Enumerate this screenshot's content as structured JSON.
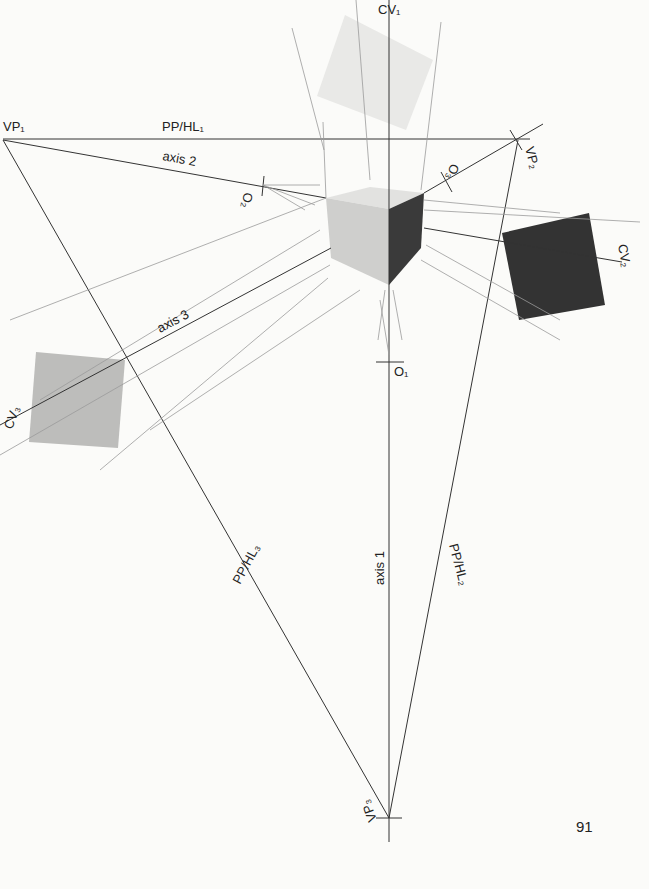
{
  "page_number": "91",
  "labels": {
    "cv1": "CV₁",
    "vp1": "VP₁",
    "pp_hl1": "PP/HL₁",
    "axis2": "axis 2",
    "o2": "O₂",
    "o3": "O₃",
    "vp2": "VP₂",
    "cv2": "CV₂",
    "axis3": "axis 3",
    "cv3": "CV₃",
    "o1": "O₁",
    "pp_hl3": "PP/HL₃",
    "axis1": "axis 1",
    "pp_hl2": "PP/HL₂",
    "vp3": "VP₃"
  },
  "colors": {
    "line": "#333333",
    "light_line": "#9a9a9a",
    "cube_top": "#e2e2e0",
    "cube_left": "#cfcfcd",
    "cube_right": "#3a3a3a",
    "square_top": "#e9e9e7",
    "square_right": "#333333",
    "square_left": "#bdbdbb"
  },
  "diagram": {
    "points": {
      "VP1": [
        3,
        140
      ],
      "VP2": [
        518,
        140
      ],
      "VP3": [
        389,
        818
      ],
      "O1": [
        389,
        363
      ],
      "O2": [
        263,
        185
      ],
      "O3": [
        444,
        183
      ],
      "CV1": [
        389,
        5
      ],
      "CV2": [
        622,
        250
      ],
      "CV3": [
        5,
        440
      ]
    }
  }
}
